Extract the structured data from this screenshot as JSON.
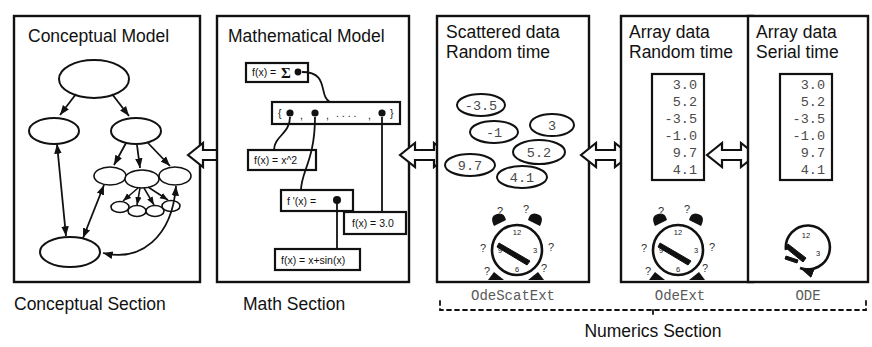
{
  "diagram": {
    "panels": [
      {
        "id": "conceptual",
        "title_line1": "Conceptual Model",
        "title_line2": "",
        "section_label": "Conceptual Section",
        "content_kind": "node-graph"
      },
      {
        "id": "mathematical",
        "title_line1": "Mathematical Model",
        "title_line2": "",
        "section_label": "Math Section",
        "content_kind": "formula-boxes",
        "boxes": [
          {
            "name": "sum-box",
            "text": "f(x) =",
            "symbol": "Σ"
          },
          {
            "name": "set-box",
            "text": "{  ,  , . . . ,   }"
          },
          {
            "name": "xsq-box",
            "text": "f(x) = x^2"
          },
          {
            "name": "deriv-box",
            "text": "f '(x) ="
          },
          {
            "name": "const-box",
            "text": "f(x) = 3.0"
          },
          {
            "name": "sin-box",
            "text": "f(x) = x+sin(x)"
          }
        ]
      },
      {
        "id": "scattered",
        "title_line1": "Scattered data",
        "title_line2": "Random time",
        "section_label": "OdeScatExt",
        "content_kind": "scatter-ellipses",
        "values": [
          "-3.5",
          "-1",
          "3",
          "5.2",
          "9.7",
          "4.1"
        ],
        "clock": "alarm-clock-random"
      },
      {
        "id": "array-random",
        "title_line1": "Array data",
        "title_line2": "Random time",
        "section_label": "OdeExt",
        "content_kind": "array-box",
        "values": [
          "3.0",
          "5.2",
          "-3.5",
          "-1.0",
          "9.7",
          "4.1"
        ],
        "clock": "alarm-clock-random"
      },
      {
        "id": "array-serial",
        "title_line1": "Array data",
        "title_line2": "Serial time",
        "section_label": "ODE",
        "content_kind": "array-box",
        "values": [
          "3.0",
          "5.2",
          "-3.5",
          "-1.0",
          "9.7",
          "4.1"
        ],
        "clock": "clock-arrow-serial"
      }
    ],
    "numerics_section_label": "Numerics Section",
    "clock_numerals": [
      "12",
      "3",
      "6",
      "9"
    ],
    "question_mark": "?",
    "connectors": [
      {
        "name": "connector-conceptual-math",
        "kind": "double-arrow"
      },
      {
        "name": "connector-math-scattered",
        "kind": "double-arrow"
      },
      {
        "name": "connector-scattered-arrayrandom",
        "kind": "double-arrow"
      },
      {
        "name": "connector-arrayrandom-arrayserial",
        "kind": "double-arrow"
      }
    ],
    "colors": {
      "ink": "#111111",
      "paper": "#ffffff",
      "mono_text": "#4a4a4a"
    }
  }
}
